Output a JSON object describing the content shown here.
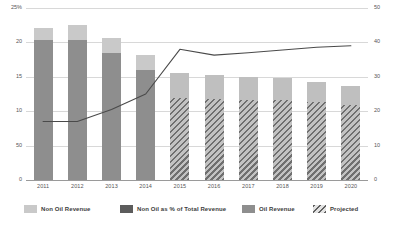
{
  "chart_data": {
    "type": "bar",
    "title": "",
    "subtitle": "",
    "xlabel": "",
    "ylabel": "",
    "categories": [
      "2011",
      "2012",
      "2013",
      "2014",
      "2015",
      "2016",
      "2017",
      "2018",
      "2019",
      "2020"
    ],
    "left_axis": {
      "ticks": [
        "25%",
        "20",
        "15",
        "10",
        "50",
        "0"
      ],
      "tick_values": [
        25,
        20,
        15,
        10,
        5,
        0
      ],
      "ylim": [
        0,
        25
      ],
      "grid": true
    },
    "right_axis": {
      "ticks": [
        "50",
        "40",
        "30",
        "20",
        "10",
        "0"
      ],
      "tick_values": [
        50,
        40,
        30,
        20,
        10,
        0
      ],
      "ylim": [
        0,
        50
      ]
    },
    "stacked": true,
    "series": [
      {
        "name": "Oil Revenue",
        "type": "bar",
        "axis": "left",
        "color": "#8e8e8e",
        "values": [
          20.4,
          20.4,
          18.5,
          16.0,
          11.9,
          11.8,
          11.7,
          11.7,
          11.3,
          10.9
        ]
      },
      {
        "name": "Non Oil Revenue",
        "type": "bar",
        "axis": "left",
        "color": "#c9c9c9",
        "values": [
          1.7,
          2.1,
          2.1,
          2.2,
          3.6,
          3.4,
          3.3,
          3.2,
          2.9,
          2.8
        ]
      },
      {
        "name": "Non Oil as % of Total Revenue",
        "type": "line",
        "axis": "right",
        "color": "#4a4a4a",
        "values": [
          17.0,
          17.0,
          20.5,
          25.0,
          38.0,
          36.3,
          37.0,
          37.8,
          38.6,
          39.0
        ]
      }
    ],
    "totals": [
      22.1,
      22.5,
      20.6,
      18.2,
      15.5,
      15.2,
      15.0,
      14.9,
      14.2,
      13.7
    ],
    "projected_categories": [
      "2015",
      "2016",
      "2017",
      "2018",
      "2019",
      "2020"
    ],
    "legend": {
      "position": "bottom",
      "entries": [
        {
          "label": "Non Oil Revenue",
          "swatch": "light-gray-solid"
        },
        {
          "label": "Non Oil as % of Total Revenue",
          "swatch": "dark-gray-solid"
        },
        {
          "label": "Oil Revenue",
          "swatch": "medium-gray-solid"
        },
        {
          "label": "Projected",
          "swatch": "diagonal-hatch"
        }
      ]
    }
  },
  "colors": {
    "oil_revenue": "#8e8e8e",
    "non_oil_revenue": "#c9c9c9",
    "line": "#4a4a4a",
    "grid": "#d8d8d8",
    "baseline": "#9a9a9a",
    "background": "#ffffff",
    "text": "#555555"
  }
}
